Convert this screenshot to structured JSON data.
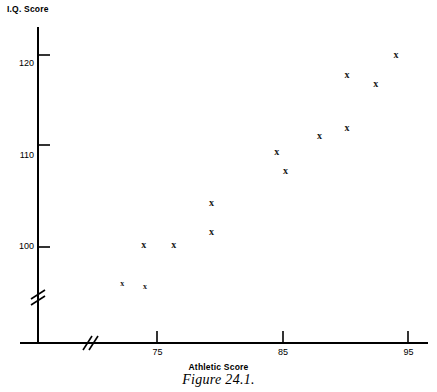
{
  "chart_data": {
    "type": "scatter",
    "title": "Figure 24.1.",
    "xlabel": "Athletic Score",
    "ylabel": "I.Q. Score",
    "xlim": [
      70.5,
      97
    ],
    "ylim": [
      93.5,
      123.5
    ],
    "xticks": [
      75,
      85,
      95
    ],
    "yticks": [
      100,
      110,
      120
    ],
    "xtick_labels": [
      "75",
      "85",
      "95"
    ],
    "ytick_labels": [
      "100",
      "110",
      "120"
    ],
    "grid": false,
    "legend": null,
    "axis_break_x": true,
    "axis_break_y": true,
    "marker_symbol": "x",
    "points": [
      {
        "x": 72.2,
        "y": 96.0,
        "label": "x",
        "size": "small"
      },
      {
        "x": 73.9,
        "y": 100.2,
        "label": "x",
        "size": "normal"
      },
      {
        "x": 74.0,
        "y": 95.6,
        "label": "x",
        "size": "small"
      },
      {
        "x": 76.3,
        "y": 100.2,
        "label": "x",
        "size": "normal"
      },
      {
        "x": 79.3,
        "y": 104.8,
        "label": "x",
        "size": "normal"
      },
      {
        "x": 79.3,
        "y": 101.6,
        "label": "x",
        "size": "normal"
      },
      {
        "x": 84.5,
        "y": 110.4,
        "label": "x",
        "size": "normal"
      },
      {
        "x": 85.2,
        "y": 108.3,
        "label": "x",
        "size": "normal"
      },
      {
        "x": 87.9,
        "y": 112.1,
        "label": "x",
        "size": "normal"
      },
      {
        "x": 90.1,
        "y": 113.0,
        "label": "x",
        "size": "normal"
      },
      {
        "x": 90.1,
        "y": 118.8,
        "label": "x",
        "size": "normal"
      },
      {
        "x": 92.4,
        "y": 117.8,
        "label": "x",
        "size": "normal"
      },
      {
        "x": 94.0,
        "y": 121.0,
        "label": "x",
        "size": "normal"
      }
    ]
  },
  "figure": {
    "ylabel": "I.Q. Score",
    "xlabel": "Athletic Score",
    "caption": "Figure 24.1."
  }
}
